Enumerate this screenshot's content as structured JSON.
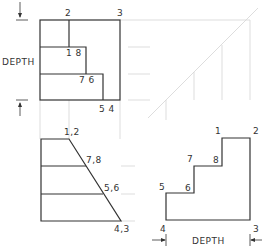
{
  "diagram": {
    "type": "orthographic-projection",
    "top_view": {
      "vertex_labels": [
        "2",
        "3",
        "1 8",
        "7 6",
        "5 4"
      ],
      "dimension_label": "DEPTH"
    },
    "front_view": {
      "vertex_labels": [
        "1,2",
        "7,8",
        "5,6",
        "4,3"
      ]
    },
    "side_view": {
      "vertex_labels": [
        "1",
        "2",
        "7",
        "8",
        "5",
        "6",
        "4",
        "3"
      ],
      "dimension_label": "DEPTH"
    },
    "miter_line": "45-degree projection line"
  }
}
